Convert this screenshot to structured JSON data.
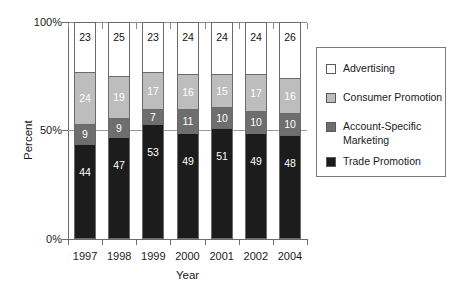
{
  "chart_data": {
    "type": "bar",
    "subtype": "stacked-100-percent",
    "title": "",
    "xlabel": "Year",
    "ylabel": "Percent",
    "categories": [
      "1997",
      "1998",
      "1999",
      "2000",
      "2001",
      "2002",
      "2004"
    ],
    "ylim": [
      0,
      100
    ],
    "ytick_labels": [
      "0%",
      "50%",
      "100%"
    ],
    "ytick_values": [
      0,
      50,
      100
    ],
    "grid": "horizontal-50-only",
    "legend_position": "right",
    "stack_order_bottom_to_top": [
      "Trade Promotion",
      "Account-Specific Marketing",
      "Consumer Promotion",
      "Advertising"
    ],
    "series": [
      {
        "name": "Trade Promotion",
        "color": "#1c1c1c",
        "label_color": "#ffffff",
        "values": [
          44,
          47,
          53,
          49,
          51,
          49,
          48
        ]
      },
      {
        "name": "Account-Specific Marketing",
        "color": "#6e6e6e",
        "label_color": "#ffffff",
        "values": [
          9,
          9,
          7,
          11,
          10,
          10,
          10
        ]
      },
      {
        "name": "Consumer Promotion",
        "color": "#bdbdbd",
        "label_color": "#ffffff",
        "values": [
          24,
          19,
          17,
          16,
          15,
          17,
          16
        ]
      },
      {
        "name": "Advertising",
        "color": "#ffffff",
        "label_color": "#111111",
        "values": [
          23,
          25,
          23,
          24,
          24,
          24,
          26
        ]
      }
    ]
  },
  "legend": {
    "items": [
      {
        "label": "Advertising",
        "color": "#ffffff"
      },
      {
        "label": "Consumer Promotion",
        "color": "#bdbdbd"
      },
      {
        "label": "Account-Specific\nMarketing",
        "color": "#6e6e6e"
      },
      {
        "label": "Trade Promotion",
        "color": "#1c1c1c"
      }
    ]
  },
  "axes": {
    "y_title": "Percent",
    "x_title": "Year",
    "y_ticks": [
      "100%",
      "50%",
      "0%"
    ],
    "x_ticks": [
      "1997",
      "1998",
      "1999",
      "2000",
      "2001",
      "2002",
      "2004"
    ]
  }
}
